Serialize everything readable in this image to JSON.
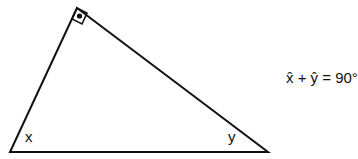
{
  "diagram": {
    "type": "right-triangle",
    "vertices": {
      "top_right_angle": [
        77,
        8
      ],
      "bottom_left": [
        10,
        152
      ],
      "bottom_right": [
        268,
        152
      ]
    },
    "stroke_color": "#111111",
    "background_color": "#ffffff",
    "right_angle_marker": "square-with-dot",
    "angle_labels": {
      "x": "x",
      "y": "y"
    },
    "formula": "x̂ + ŷ = 90°"
  }
}
